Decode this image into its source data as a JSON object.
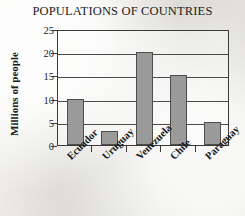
{
  "chart_data": {
    "type": "bar",
    "title": "POPULATIONS OF COUNTRIES",
    "xlabel": "",
    "ylabel": "Millions of people",
    "categories": [
      "Ecuador",
      "Uruguay",
      "Venezuela",
      "Chile",
      "Paraguay"
    ],
    "values": [
      10,
      3,
      20,
      15,
      5
    ],
    "ylim": [
      0,
      25
    ],
    "y_ticks": [
      0,
      5,
      10,
      15,
      20,
      25
    ],
    "y_tick_labels": [
      "0",
      "5",
      "10",
      "15",
      "20",
      "25"
    ],
    "grid": "horizontal",
    "legend": "none",
    "bar_color": "#9a9a9a",
    "bar_edge_color": "#4d4d4d",
    "axis_color": "#3a3a3a",
    "text_color": "#1a1a1a",
    "background_color": "#efeeea"
  }
}
